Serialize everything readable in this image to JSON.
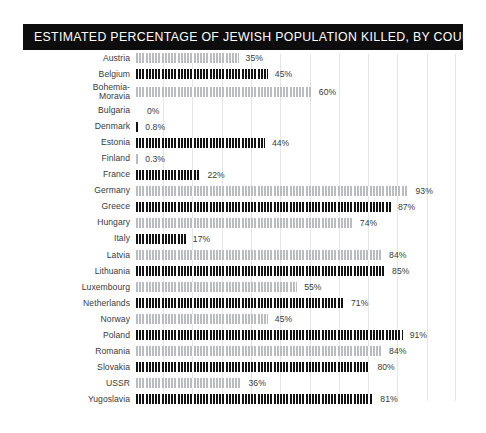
{
  "header": {
    "title": "ESTIMATED PERCENTAGE OF JEWISH POPULATION KILLED, BY COUNTRY"
  },
  "colors": {
    "title_bar_bg": "#0d0d0d",
    "title_text": "#ffffff",
    "bar_dark": "#131313",
    "bar_light": "#b9bcc0",
    "gridline": "#e4e7ea",
    "frame": "#1a1a1a",
    "label_text": "#3b3b3b",
    "background": "#ffffff"
  },
  "chart_data": {
    "type": "bar",
    "orientation": "horizontal",
    "title": "ESTIMATED PERCENTAGE OF JEWISH POPULATION KILLED, BY COUNTRY",
    "xlabel": "",
    "ylabel": "",
    "xlim": [
      0,
      100
    ],
    "grid": true,
    "gridlines_x": [
      0,
      10,
      20,
      30,
      40,
      50,
      60,
      70,
      80,
      90,
      100
    ],
    "legend": null,
    "unit": "%",
    "categories": [
      "Austria",
      "Belgium",
      "Bohemia-\nMoravia",
      "Bulgaria",
      "Denmark",
      "Estonia",
      "Finland",
      "France",
      "Germany",
      "Greece",
      "Hungary",
      "Italy",
      "Latvia",
      "Lithuania",
      "Luxembourg",
      "Netherlands",
      "Norway",
      "Poland",
      "Romania",
      "Slovakia",
      "USSR",
      "Yugoslavia"
    ],
    "values": [
      35,
      45,
      60,
      0,
      0.8,
      44,
      0.3,
      22,
      93,
      87,
      74,
      17,
      84,
      85,
      55,
      71,
      45,
      91,
      84,
      80,
      36,
      81
    ],
    "labels": [
      "35%",
      "45%",
      "60%",
      "0%",
      "0.8%",
      "44%",
      "0.3%",
      "22%",
      "93%",
      "87%",
      "74%",
      "17%",
      "84%",
      "85%",
      "55%",
      "71%",
      "45%",
      "91%",
      "84%",
      "80%",
      "36%",
      "81%"
    ],
    "bar_shades": [
      "light",
      "dark",
      "light",
      "none",
      "dark",
      "dark",
      "light",
      "dark",
      "light",
      "dark",
      "light",
      "dark",
      "light",
      "dark",
      "light",
      "dark",
      "light",
      "dark",
      "light",
      "dark",
      "light",
      "dark"
    ]
  }
}
